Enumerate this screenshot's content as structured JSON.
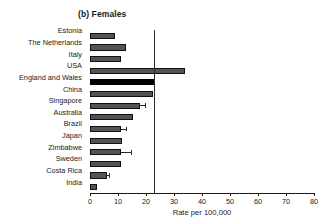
{
  "chart_data": {
    "type": "bar",
    "orientation": "horizontal",
    "title": "(b) Females",
    "xlabel": "Rate per 100,000",
    "ylabel": "",
    "xlim": [
      0,
      80
    ],
    "xticks": [
      0,
      10,
      20,
      30,
      40,
      50,
      60,
      70,
      80
    ],
    "xtick_labels": [
      "0",
      "10",
      "20",
      "30",
      "40",
      "50",
      "60",
      "70",
      "80"
    ],
    "grid": false,
    "legend": "none",
    "reference_line": {
      "value": 23,
      "orientation": "vertical",
      "color": "#2b2b2b"
    },
    "bar_color": "#535353",
    "highlight_color": "#000000",
    "highlight_category": "England and Wales",
    "categories": [
      "Estonia",
      "The Netherlands",
      "Italy",
      "USA",
      "England and Wales",
      "China",
      "Singapore",
      "Australia",
      "Brazil",
      "Japan",
      "Zimbabwe",
      "Sweden",
      "Costa Rica",
      "India"
    ],
    "values": [
      9.0,
      13.0,
      11.0,
      34.0,
      23.0,
      22.5,
      18.0,
      15.5,
      11.0,
      11.5,
      11.0,
      11.0,
      6.0,
      2.5
    ],
    "error_upper": [
      0,
      0,
      0,
      0,
      0,
      0,
      19.5,
      0,
      13.0,
      0,
      14.5,
      0,
      6.8,
      0
    ]
  }
}
